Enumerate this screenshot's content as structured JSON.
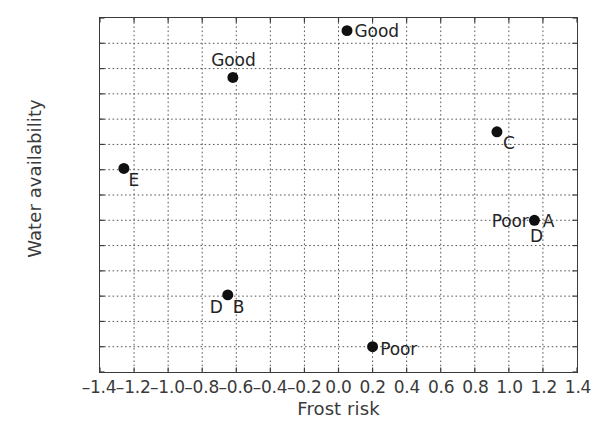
{
  "chart_data": {
    "type": "scatter",
    "title": "",
    "xlabel": "Frost risk",
    "ylabel": "Water availability",
    "xlim": [
      -1.4,
      1.4
    ],
    "ylim": [
      -1.4,
      1.4
    ],
    "grid": true,
    "legend": "none",
    "xticks": [
      "–1.4",
      "–1.2",
      "–1.0",
      "–0.8",
      "–0.6",
      "–0.4",
      "–0.2",
      "0.0",
      "0.2",
      "0.4",
      "0.6",
      "0.8",
      "1.0",
      "1.2",
      "1.4"
    ],
    "xtick_values": [
      -1.4,
      -1.2,
      -1.0,
      -0.8,
      -0.6,
      -0.4,
      -0.2,
      0.0,
      0.2,
      0.4,
      0.6,
      0.8,
      1.0,
      1.2,
      1.4
    ],
    "yticks": [
      "1.4",
      "1.2",
      "1.0",
      "0.8",
      "0.6",
      "0.4",
      "0.2",
      "0.0",
      "–0.2",
      "–0.4",
      "–0.6",
      "–0.8",
      "–1.0",
      "–1.2",
      "–1.4"
    ],
    "ytick_values": [
      1.4,
      1.2,
      1.0,
      0.8,
      0.6,
      0.4,
      0.2,
      0.0,
      -0.2,
      -0.4,
      -0.6,
      -0.8,
      -1.0,
      -1.2,
      -1.4
    ],
    "marker": "filled-circle",
    "marker_color": "#101010",
    "marker_size": 11,
    "points": [
      {
        "x": 0.05,
        "y": 1.3,
        "labels": [
          {
            "text": "Good",
            "pos": "right"
          }
        ]
      },
      {
        "x": -0.62,
        "y": 0.93,
        "labels": [
          {
            "text": "Good",
            "pos": "above"
          }
        ]
      },
      {
        "x": 0.93,
        "y": 0.5,
        "labels": [
          {
            "text": "C",
            "pos": "below-right"
          }
        ]
      },
      {
        "x": -1.26,
        "y": 0.21,
        "labels": [
          {
            "text": "E",
            "pos": "below-right"
          }
        ]
      },
      {
        "x": 1.15,
        "y": -0.2,
        "labels": [
          {
            "text": "Poor",
            "pos": "left"
          },
          {
            "text": "A",
            "pos": "right"
          },
          {
            "text": "D",
            "pos": "below"
          }
        ]
      },
      {
        "x": -0.65,
        "y": -0.79,
        "labels": [
          {
            "text": "D",
            "pos": "below-left"
          },
          {
            "text": "B",
            "pos": "below-right"
          }
        ]
      },
      {
        "x": 0.2,
        "y": -1.2,
        "labels": [
          {
            "text": "Poor",
            "pos": "right"
          }
        ]
      }
    ]
  }
}
